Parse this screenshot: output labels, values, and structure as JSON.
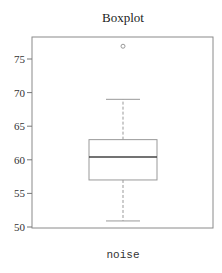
{
  "chart_data": {
    "type": "boxplot",
    "title": "Boxplot",
    "xlabel": "",
    "ylabel": "",
    "categories": [
      "noise"
    ],
    "series": [
      {
        "name": "noise",
        "whisker_low": 50.9,
        "q1": 57.0,
        "median": 60.4,
        "q3": 63.0,
        "whisker_high": 69.0,
        "outliers": [
          76.9
        ]
      }
    ],
    "ylim": [
      49.8,
      78.3
    ],
    "yticks": [
      50,
      55,
      60,
      65,
      70,
      75
    ],
    "ytick_labels": [
      "50",
      "55",
      "60",
      "65",
      "70",
      "75"
    ],
    "grid": false,
    "legend": null
  },
  "colors": {
    "frame": "#888888",
    "box": "#999999",
    "median": "#444444",
    "text": "#333333"
  }
}
